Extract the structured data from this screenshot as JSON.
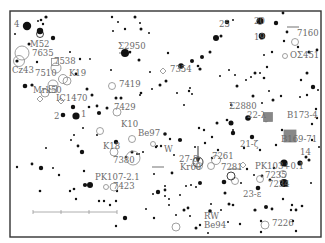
{
  "map": {
    "title": "Star chart",
    "frame": {
      "x": 10,
      "y": 11,
      "w": 311,
      "h": 226
    },
    "colors": {
      "star": "#111111",
      "label": "#6a6a6a",
      "frame": "#333333",
      "nebula": "#888888"
    },
    "scale_bar": {
      "x1": 33,
      "x2": 117,
      "y": 212,
      "ticks": [
        33,
        61,
        89,
        117
      ]
    },
    "pointer_arrow": {
      "x": 198,
      "y1": 168,
      "y2": 146
    }
  },
  "labels": [
    {
      "id": "star-4",
      "text": "4",
      "x": 14,
      "y": 27
    },
    {
      "id": "m52",
      "text": "M52",
      "x": 30,
      "y": 47
    },
    {
      "id": "ngc7635",
      "text": "7635",
      "x": 32,
      "y": 56
    },
    {
      "id": "ngc7538",
      "text": "7538",
      "x": 54,
      "y": 64
    },
    {
      "id": "cz43",
      "text": "Cz43",
      "x": 12,
      "y": 73
    },
    {
      "id": "ngc7510",
      "text": "7510",
      "x": 35,
      "y": 76
    },
    {
      "id": "k19",
      "text": "K19",
      "x": 69,
      "y": 76
    },
    {
      "id": "mrk50",
      "text": "Mrk50",
      "x": 33,
      "y": 93
    },
    {
      "id": "ic1470",
      "text": "IC1470",
      "x": 56,
      "y": 101
    },
    {
      "id": "star-2",
      "text": "2",
      "x": 54,
      "y": 119
    },
    {
      "id": "star-1",
      "text": "1",
      "x": 81,
      "y": 117
    },
    {
      "id": "sigma2950",
      "text": "Σ2950",
      "x": 118,
      "y": 49
    },
    {
      "id": "ngc7354",
      "text": "7354",
      "x": 170,
      "y": 72
    },
    {
      "id": "ngc7419",
      "text": "7419",
      "x": 119,
      "y": 87
    },
    {
      "id": "ngc7429",
      "text": "7429",
      "x": 114,
      "y": 110
    },
    {
      "id": "star-25",
      "text": "25",
      "x": 219,
      "y": 27
    },
    {
      "id": "star-20",
      "text": "20",
      "x": 254,
      "y": 24
    },
    {
      "id": "star-19",
      "text": "19",
      "x": 254,
      "y": 40
    },
    {
      "id": "ngc7160",
      "text": "7160",
      "x": 297,
      "y": 36
    },
    {
      "id": "osigma451",
      "text": "OΣ451",
      "x": 290,
      "y": 58
    },
    {
      "id": "sigma2880",
      "text": "Σ2880",
      "x": 229,
      "y": 109
    },
    {
      "id": "star-22-lambda",
      "text": "22-λ",
      "x": 247,
      "y": 118
    },
    {
      "id": "b173-4",
      "text": "B173-4",
      "x": 287,
      "y": 118
    },
    {
      "id": "b169-71",
      "text": "B169-71",
      "x": 281,
      "y": 142
    },
    {
      "id": "k10",
      "text": "K10",
      "x": 121,
      "y": 127
    },
    {
      "id": "be97",
      "text": "Be97",
      "x": 138,
      "y": 136
    },
    {
      "id": "k18",
      "text": "K18",
      "x": 103,
      "y": 149
    },
    {
      "id": "star-w",
      "text": "W",
      "x": 164,
      "y": 152
    },
    {
      "id": "ngc7380",
      "text": "7380",
      "x": 113,
      "y": 163
    },
    {
      "id": "star-27-delta",
      "text": "27-δ",
      "x": 179,
      "y": 162
    },
    {
      "id": "ngc7261",
      "text": "7261",
      "x": 212,
      "y": 159
    },
    {
      "id": "star-21-zeta",
      "text": "21-ζ",
      "x": 240,
      "y": 147
    },
    {
      "id": "star-14",
      "text": "14",
      "x": 300,
      "y": 155
    },
    {
      "id": "kr60",
      "text": "Kr60",
      "x": 180,
      "y": 170
    },
    {
      "id": "ngc7281",
      "text": "7281",
      "x": 221,
      "y": 170
    },
    {
      "id": "pk103",
      "text": "PK103+0.1",
      "x": 255,
      "y": 169
    },
    {
      "id": "ngc7235",
      "text": "7235",
      "x": 265,
      "y": 178
    },
    {
      "id": "ngc7234",
      "text": "7234",
      "x": 268,
      "y": 187
    },
    {
      "id": "star-23-epsilon",
      "text": "23-ε",
      "x": 243,
      "y": 197
    },
    {
      "id": "pk107",
      "text": "PK107-2.1",
      "x": 95,
      "y": 180
    },
    {
      "id": "ngc7423",
      "text": "7423",
      "x": 113,
      "y": 189
    },
    {
      "id": "rw",
      "text": "RW",
      "x": 204,
      "y": 219
    },
    {
      "id": "be94",
      "text": "Be94",
      "x": 204,
      "y": 228
    },
    {
      "id": "ngc7226",
      "text": "7226",
      "x": 272,
      "y": 226
    }
  ],
  "stars": [
    [
      27,
      26,
      4.2
    ],
    [
      41,
      20,
      1.3
    ],
    [
      46,
      17,
      1.6
    ],
    [
      43,
      24,
      1.2
    ],
    [
      38,
      21,
      1
    ],
    [
      40,
      31,
      3.2
    ],
    [
      15,
      34,
      1
    ],
    [
      53,
      38,
      2.2
    ],
    [
      29,
      44,
      1.5
    ],
    [
      17,
      61,
      1.6
    ],
    [
      37,
      62,
      1.2
    ],
    [
      70,
      52,
      1
    ],
    [
      80,
      59,
      1.2
    ],
    [
      90,
      59,
      0.9
    ],
    [
      76,
      74,
      1.4
    ],
    [
      25,
      86,
      2.3
    ],
    [
      32,
      85,
      1.6
    ],
    [
      87,
      89,
      1.5
    ],
    [
      92,
      95,
      1.5
    ],
    [
      73,
      107,
      2.2
    ],
    [
      76,
      116,
      3.6
    ],
    [
      63,
      115,
      2.3
    ],
    [
      89,
      107,
      1.3
    ],
    [
      99,
      113,
      2.1
    ],
    [
      107,
      108,
      1.5
    ],
    [
      71,
      140,
      1
    ],
    [
      78,
      146,
      1.4
    ],
    [
      82,
      152,
      2.2
    ],
    [
      84,
      171,
      1.2
    ],
    [
      17,
      167,
      1.2
    ],
    [
      32,
      164,
      1.4
    ],
    [
      41,
      168,
      2.2
    ],
    [
      53,
      168,
      1
    ],
    [
      59,
      175,
      1.2
    ],
    [
      40,
      191,
      1.3
    ],
    [
      70,
      191,
      1.2
    ],
    [
      74,
      189,
      1.3
    ],
    [
      76,
      199,
      1.2
    ],
    [
      85,
      185,
      2.1
    ],
    [
      90,
      185,
      3
    ],
    [
      99,
      201,
      1.2
    ],
    [
      104,
      201,
      1.2
    ],
    [
      110,
      205,
      1.2
    ],
    [
      116,
      201,
      1.2
    ],
    [
      117,
      191,
      1.2
    ],
    [
      125,
      218,
      2.2
    ],
    [
      116,
      226,
      1.2
    ],
    [
      153,
      194,
      1
    ],
    [
      165,
      190,
      1.4
    ],
    [
      180,
      140,
      2.1
    ],
    [
      205,
      143,
      1.2
    ],
    [
      231,
      123,
      2.5
    ],
    [
      248,
      118,
      2.8
    ],
    [
      244,
      148,
      1.2
    ],
    [
      266,
      120,
      2.2
    ],
    [
      233,
      133,
      2.2
    ],
    [
      252,
      137,
      2.2
    ],
    [
      260,
      150,
      1.2
    ],
    [
      282,
      130,
      1.2
    ],
    [
      312,
      140,
      1.2
    ],
    [
      276,
      145,
      1.2
    ],
    [
      284,
      183,
      4
    ],
    [
      284,
      163,
      3.6
    ],
    [
      300,
      163,
      2.6
    ],
    [
      309,
      160,
      1.5
    ],
    [
      241,
      183,
      1
    ],
    [
      247,
      169,
      1.2
    ],
    [
      254,
      175,
      1
    ],
    [
      292,
      205,
      1.2
    ],
    [
      283,
      199,
      1.2
    ],
    [
      293,
      221,
      1.2
    ],
    [
      261,
      221,
      1.2
    ],
    [
      261,
      232,
      1.2
    ],
    [
      296,
      231,
      1.2
    ],
    [
      287,
      186,
      1
    ],
    [
      311,
      183,
      1
    ],
    [
      291,
      210,
      1.2
    ],
    [
      210,
      211,
      1.8
    ],
    [
      211,
      204,
      1
    ],
    [
      169,
      199,
      1
    ],
    [
      169,
      205,
      1
    ],
    [
      165,
      196,
      1
    ],
    [
      158,
      192,
      2.2
    ],
    [
      172,
      173,
      1.4
    ],
    [
      212,
      158,
      1.2
    ],
    [
      224,
      182,
      2.3
    ],
    [
      233,
      205,
      1.3
    ],
    [
      266,
      207,
      2
    ],
    [
      272,
      209,
      1.4
    ],
    [
      255,
      210,
      1.6
    ],
    [
      270,
      180,
      1.4
    ],
    [
      296,
      210,
      1.4
    ],
    [
      302,
      206,
      1.3
    ],
    [
      200,
      183,
      2
    ],
    [
      200,
      225,
      1.2
    ],
    [
      229,
      204,
      1.5
    ],
    [
      240,
      224,
      1.2
    ],
    [
      165,
      134,
      1.8
    ],
    [
      170,
      139,
      1.2
    ],
    [
      161,
      146,
      1.2
    ],
    [
      156,
      147,
      1.2
    ],
    [
      137,
      154,
      1
    ],
    [
      154,
      174,
      1
    ],
    [
      126,
      157,
      1.2
    ],
    [
      97,
      106,
      1.4
    ],
    [
      116,
      142,
      2.2
    ],
    [
      132,
      152,
      1.5
    ],
    [
      165,
      186,
      1
    ],
    [
      199,
      128,
      1.2
    ],
    [
      204,
      130,
      1.2
    ],
    [
      157,
      146,
      1
    ],
    [
      143,
      152,
      1
    ],
    [
      174,
      155,
      1
    ],
    [
      139,
      154,
      1
    ],
    [
      139,
      60,
      1.5
    ],
    [
      141,
      29,
      1.5
    ],
    [
      135,
      17,
      1.5
    ],
    [
      140,
      23,
      1
    ],
    [
      113,
      31,
      1
    ],
    [
      112,
      17,
      1.2
    ],
    [
      118,
      22,
      1
    ],
    [
      125,
      29,
      1.2
    ],
    [
      149,
      33,
      1
    ],
    [
      125,
      53,
      4
    ],
    [
      130,
      52,
      1.3
    ],
    [
      111,
      70,
      1
    ],
    [
      150,
      72,
      1
    ],
    [
      152,
      89,
      1
    ],
    [
      141,
      93,
      1.3
    ],
    [
      140,
      95,
      1
    ],
    [
      160,
      85,
      1.5
    ],
    [
      177,
      93,
      1
    ],
    [
      189,
      91,
      1.2
    ],
    [
      192,
      94,
      1
    ],
    [
      190,
      88,
      1
    ],
    [
      184,
      105,
      1
    ],
    [
      166,
      81,
      1.5
    ],
    [
      121,
      98,
      1.5
    ],
    [
      116,
      98,
      1.5
    ],
    [
      168,
      53,
      1.2
    ],
    [
      181,
      66,
      2.8
    ],
    [
      192,
      61,
      2
    ],
    [
      198,
      66,
      1.3
    ],
    [
      202,
      57,
      2
    ],
    [
      210,
      52,
      1.5
    ],
    [
      200,
      69,
      1.6
    ],
    [
      221,
      36,
      1.5
    ],
    [
      227,
      22,
      2.3
    ],
    [
      216,
      38,
      3
    ],
    [
      233,
      20,
      1
    ],
    [
      220,
      76,
      1
    ],
    [
      246,
      80,
      1
    ],
    [
      251,
      77,
      1
    ],
    [
      253,
      96,
      1.5
    ],
    [
      237,
      86,
      1.5
    ],
    [
      229,
      70,
      1
    ],
    [
      235,
      75,
      1
    ],
    [
      255,
      73,
      1.5
    ],
    [
      260,
      73,
      1
    ],
    [
      267,
      67,
      1.2
    ],
    [
      264,
      78,
      1.3
    ],
    [
      269,
      91,
      1
    ],
    [
      262,
      103,
      1
    ],
    [
      273,
      100,
      1.5
    ],
    [
      281,
      96,
      1.2
    ],
    [
      264,
      55,
      1
    ],
    [
      272,
      52,
      1.2
    ],
    [
      262,
      36,
      3.3
    ],
    [
      260,
      21,
      3.5
    ],
    [
      276,
      23,
      2.2
    ],
    [
      283,
      13,
      1.4
    ],
    [
      287,
      32,
      1.4
    ],
    [
      284,
      41,
      1.2
    ],
    [
      298,
      47,
      1.2
    ],
    [
      309,
      52,
      1.6
    ],
    [
      307,
      73,
      1.5
    ],
    [
      313,
      87,
      2.2
    ],
    [
      301,
      80,
      1.2
    ],
    [
      300,
      97,
      1
    ],
    [
      318,
      90,
      1
    ],
    [
      317,
      50,
      1.4
    ],
    [
      307,
      95,
      1.2
    ],
    [
      316,
      109,
      1.2
    ],
    [
      317,
      118,
      1.2
    ],
    [
      319,
      147,
      1
    ],
    [
      312,
      124,
      1.2
    ],
    [
      231,
      105,
      1
    ],
    [
      227,
      120,
      1.3
    ],
    [
      233,
      130,
      1
    ],
    [
      217,
      123,
      1.5
    ],
    [
      212,
      137,
      1.2
    ],
    [
      218,
      150,
      1.2
    ],
    [
      191,
      185,
      1
    ],
    [
      195,
      147,
      1
    ],
    [
      196,
      187,
      1
    ],
    [
      180,
      195,
      1
    ],
    [
      186,
      186,
      1
    ],
    [
      208,
      233,
      1
    ],
    [
      146,
      209,
      1
    ],
    [
      154,
      218,
      1.2
    ],
    [
      176,
      215,
      1
    ],
    [
      184,
      210,
      1.5
    ],
    [
      188,
      208,
      1.4
    ],
    [
      190,
      216,
      1
    ],
    [
      196,
      228,
      1.5
    ],
    [
      221,
      210,
      1
    ],
    [
      228,
      222,
      1
    ],
    [
      225,
      193,
      1.5
    ],
    [
      258,
      188,
      2.3
    ],
    [
      262,
      176,
      1.4
    ],
    [
      274,
      168,
      1.3
    ],
    [
      306,
      157,
      1.5
    ],
    [
      97,
      135,
      1
    ],
    [
      46,
      148,
      1
    ],
    [
      74,
      135,
      1
    ],
    [
      83,
      128,
      1
    ]
  ],
  "open_clusters": [
    [
      22,
      53,
      7
    ],
    [
      19,
      61,
      5.5
    ],
    [
      56,
      68,
      5
    ],
    [
      53,
      85,
      5
    ],
    [
      63,
      79,
      4.5
    ],
    [
      67,
      81,
      4
    ],
    [
      45,
      93,
      4
    ],
    [
      112,
      86,
      3.5
    ],
    [
      117,
      112,
      4
    ],
    [
      100,
      131,
      3.5
    ],
    [
      114,
      152,
      4
    ],
    [
      133,
      158,
      7
    ],
    [
      199,
      166,
      3.5
    ],
    [
      216,
      160,
      4.5
    ],
    [
      211,
      166,
      3.5
    ],
    [
      235,
      181,
      3.5
    ],
    [
      260,
      179,
      3.5
    ],
    [
      283,
      174,
      3.5
    ],
    [
      114,
      187,
      4
    ],
    [
      106,
      187,
      2.5
    ],
    [
      176,
      227,
      4
    ],
    [
      265,
      225,
      4
    ],
    [
      153,
      144,
      2.5
    ],
    [
      132,
      139,
      3.5
    ],
    [
      295,
      42,
      3.5
    ],
    [
      285,
      56,
      2.5
    ]
  ],
  "ringed_stars": [
    [
      198,
      162,
      5
    ],
    [
      231,
      176,
      4
    ],
    [
      40,
      34,
      3.5
    ]
  ],
  "nebulae_squares": [
    [
      55,
      62,
      7
    ],
    [
      53,
      89,
      7
    ],
    [
      268,
      117,
      9
    ],
    [
      290,
      136,
      12
    ]
  ],
  "planetary_nebulae": [
    [
      163,
      71
    ],
    [
      243,
      165
    ],
    [
      61,
      101
    ],
    [
      40,
      99
    ]
  ],
  "crossed_stars": [
    [
      125,
      53
    ],
    [
      158,
      167
    ],
    [
      235,
      169
    ],
    [
      293,
      27
    ]
  ]
}
